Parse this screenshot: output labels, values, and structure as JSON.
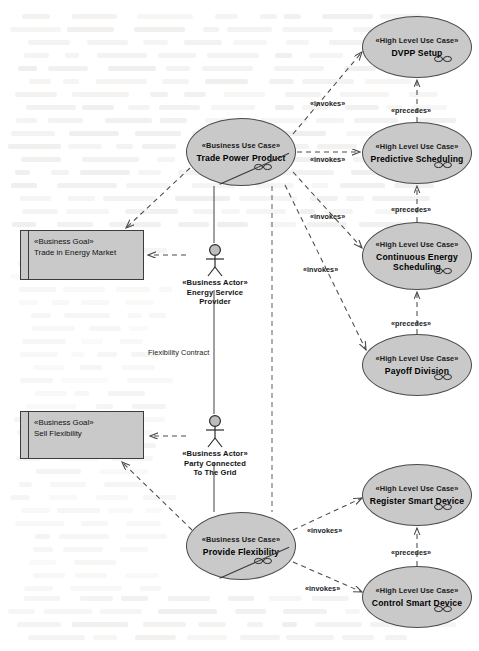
{
  "diagram": {
    "colors": {
      "node_fill": "#c9c9c9",
      "node_stroke": "#4a4a4a",
      "edge": "#4a4a4a",
      "background": "#ffffff"
    }
  },
  "use_cases": [
    {
      "id": "trade-power-product",
      "stereotype": "«Business Use Case»",
      "name": "Trade Power Product",
      "kind": "business",
      "x": 186,
      "y": 118,
      "w": 110,
      "h": 68
    },
    {
      "id": "provide-flexibility",
      "stereotype": "«Business Use Case»",
      "name": "Provide Flexibility",
      "kind": "business",
      "x": 186,
      "y": 512,
      "w": 110,
      "h": 68
    },
    {
      "id": "dvpp-setup",
      "stereotype": "«High Level Use Case»",
      "name": "DVPP Setup",
      "kind": "high-level",
      "x": 362,
      "y": 16,
      "w": 110,
      "h": 62
    },
    {
      "id": "predictive-scheduling",
      "stereotype": "«High Level Use Case»",
      "name": "Predictive Scheduling",
      "kind": "high-level",
      "x": 362,
      "y": 122,
      "w": 110,
      "h": 62
    },
    {
      "id": "continuous-energy-scheduling",
      "stereotype": "«High Level Use Case»",
      "name": "Continuous Energy Scheduling",
      "kind": "high-level",
      "x": 362,
      "y": 222,
      "w": 110,
      "h": 68
    },
    {
      "id": "payoff-division",
      "stereotype": "«High Level Use Case»",
      "name": "Payoff Division",
      "kind": "high-level",
      "x": 362,
      "y": 334,
      "w": 110,
      "h": 62
    },
    {
      "id": "register-smart-device",
      "stereotype": "«High Level Use Case»",
      "name": "Register Smart Device",
      "kind": "high-level",
      "x": 362,
      "y": 464,
      "w": 110,
      "h": 62
    },
    {
      "id": "control-smart-device",
      "stereotype": "«High Level Use Case»",
      "name": "Control Smart Device",
      "kind": "high-level",
      "x": 362,
      "y": 566,
      "w": 110,
      "h": 62
    }
  ],
  "goals": [
    {
      "id": "trade-in-energy-market",
      "stereotype": "«Business Goal»",
      "name": "Trade in Energy Market",
      "x": 20,
      "y": 230,
      "w": 124,
      "h": 50
    },
    {
      "id": "sell-flexibility",
      "stereotype": "«Business Goal»",
      "name": "Sell Flexibility",
      "x": 20,
      "y": 411,
      "w": 124,
      "h": 48
    }
  ],
  "actors": [
    {
      "id": "energy-service-provider",
      "stereotype": "«Business Actor»",
      "name_line1": "Energy Service",
      "name_line2": "Provider",
      "x": 155,
      "y": 243
    },
    {
      "id": "party-connected-to-the-grid",
      "stereotype": "«Business Actor»",
      "name_line1": "Party Connected",
      "name_line2": "To The Grid",
      "x": 155,
      "y": 414
    }
  ],
  "edge_labels": [
    {
      "id": "invokes-dvpp",
      "text": "«invokes»",
      "x": 310,
      "y": 99
    },
    {
      "id": "invokes-predictive",
      "text": "«invokes»",
      "x": 310,
      "y": 155
    },
    {
      "id": "invokes-continuous",
      "text": "«invokes»",
      "x": 310,
      "y": 212
    },
    {
      "id": "invokes-payoff",
      "text": "«invokes»",
      "x": 303,
      "y": 265
    },
    {
      "id": "invokes-register",
      "text": "«invokes»",
      "x": 307,
      "y": 526
    },
    {
      "id": "invokes-control",
      "text": "«invokes»",
      "x": 305,
      "y": 584
    },
    {
      "id": "precedes-1",
      "text": "«precedes»",
      "x": 391,
      "y": 106
    },
    {
      "id": "precedes-2",
      "text": "«precedes»",
      "x": 391,
      "y": 205
    },
    {
      "id": "precedes-3",
      "text": "«precedes»",
      "x": 391,
      "y": 319
    },
    {
      "id": "precedes-4",
      "text": "«precedes»",
      "x": 391,
      "y": 548
    },
    {
      "id": "flexibility-contract",
      "text": "Flexibility Contract",
      "x": 148,
      "y": 348,
      "plain": true
    }
  ]
}
